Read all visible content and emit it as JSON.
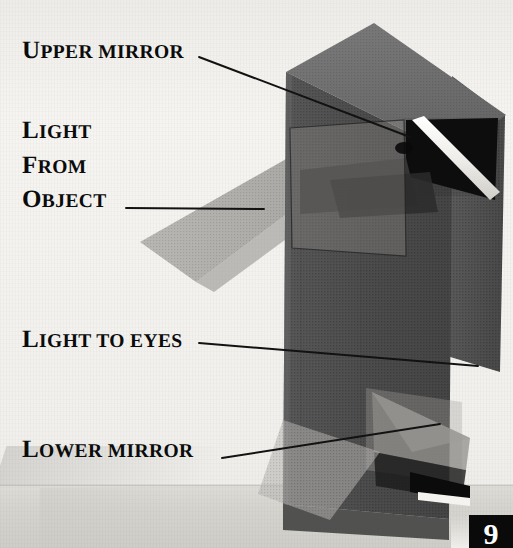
{
  "figure": {
    "page_number": "9"
  },
  "labels": {
    "upper_mirror": {
      "first": "U",
      "rest": "PPER MIRROR"
    },
    "light_from_object": {
      "line1_first": "L",
      "line1_rest": "IGHT",
      "line2_first": "F",
      "line2_rest": "ROM",
      "line3_first": "O",
      "line3_rest": "BJECT"
    },
    "light_to_eyes": {
      "first": "L",
      "rest": "IGHT TO EYES"
    },
    "lower_mirror": {
      "first": "L",
      "rest": "OWER MIRROR"
    }
  },
  "colors": {
    "paper": "#f3f2ef",
    "box_front": "#4d4d4d",
    "box_top": "#6f6f6f",
    "box_right": "#565656",
    "mirror_white": "#f4f3ef",
    "shadow_black": "#0d0d0d",
    "beam_gray": "#a9a8a4",
    "leader_line": "#121212",
    "table": "#d6d4cf",
    "badge_bg": "#0a0a0a",
    "badge_text": "#ffffff"
  },
  "parts": {
    "upper_mirror_name": "upper mirror",
    "lower_mirror_name": "lower mirror",
    "incoming_beam_name": "light from object",
    "outgoing_beam_name": "light to eyes",
    "body_name": "periscope body"
  }
}
